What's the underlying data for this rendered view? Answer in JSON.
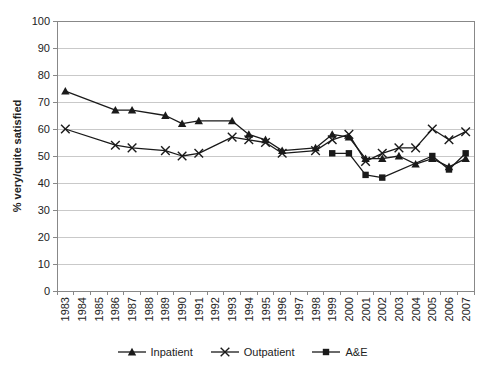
{
  "figure": {
    "ylabel": "% very/quite satisfied"
  },
  "chart_data": {
    "type": "line",
    "title": "",
    "xlabel": "",
    "ylabel": "% very/quite satisfied",
    "ylim": [
      0,
      100
    ],
    "ytick_step": 10,
    "grid": "horizontal",
    "legend_position": "bottom",
    "line_color": "#1a1a1a",
    "gridline_color": "#c9c9c9",
    "axis_color": "#888888",
    "categories": [
      "1983",
      "1984",
      "1985",
      "1986",
      "1987",
      "1988",
      "1989",
      "1990",
      "1991",
      "1992",
      "1993",
      "1994",
      "1995",
      "1996",
      "1997",
      "1998",
      "1999",
      "2000",
      "2001",
      "2002",
      "2003",
      "2004",
      "2005",
      "2006",
      "2007"
    ],
    "series": [
      {
        "name": "Inpatient",
        "marker": "triangle",
        "color": "#1a1a1a",
        "points": {
          "1983": 74,
          "1986": 67,
          "1987": 67,
          "1989": 65,
          "1990": 62,
          "1991": 63,
          "1993": 63,
          "1994": 58,
          "1995": 56,
          "1996": 52,
          "1998": 53,
          "1999": 58,
          "2000": 57,
          "2001": 49,
          "2002": 49,
          "2003": 50,
          "2004": 47,
          "2005": 49,
          "2006": 46,
          "2007": 49
        }
      },
      {
        "name": "Outpatient",
        "marker": "x",
        "color": "#1a1a1a",
        "points": {
          "1983": 60,
          "1986": 54,
          "1987": 53,
          "1989": 52,
          "1990": 50,
          "1991": 51,
          "1993": 57,
          "1994": 56,
          "1995": 55,
          "1996": 51,
          "1998": 52,
          "1999": 56,
          "2000": 58,
          "2001": 48,
          "2002": 51,
          "2003": 53,
          "2004": 53,
          "2005": 60,
          "2006": 56,
          "2007": 59
        }
      },
      {
        "name": "A&E",
        "marker": "square",
        "color": "#1a1a1a",
        "points": {
          "1999": 51,
          "2000": 51,
          "2001": 43,
          "2002": 42,
          "2005": 50,
          "2006": 45,
          "2007": 51
        }
      }
    ]
  }
}
